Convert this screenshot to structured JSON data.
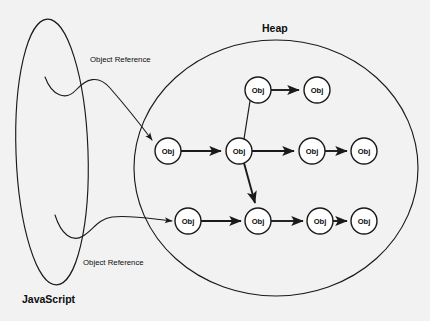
{
  "diagram": {
    "title_visible": false,
    "background_color": "#f2f2f2",
    "line_color": "#1a1a1a",
    "node_fill": "#ffffff",
    "regions": [
      {
        "id": "javascript",
        "label": "JavaScript",
        "shape": "ellipse",
        "label_x": 22,
        "label_y": 303,
        "cx": 52,
        "cy": 152,
        "rx": 36,
        "ry": 133,
        "rotation": -2
      },
      {
        "id": "heap",
        "label": "Heap",
        "shape": "ellipse",
        "label_x": 262,
        "label_y": 32,
        "cx": 276,
        "cy": 168,
        "rx": 142,
        "ry": 128,
        "rotation": 0
      }
    ],
    "reference_labels": [
      {
        "id": "ref-top",
        "text": "Object Reference",
        "x": 90,
        "y": 62
      },
      {
        "id": "ref-bottom",
        "text": "Object Reference",
        "x": 83,
        "y": 265
      }
    ],
    "node_label": "Obj",
    "node_radius": 13,
    "nodes": [
      {
        "id": "t1",
        "label": "Obj",
        "x": 258,
        "y": 90,
        "row": "top"
      },
      {
        "id": "t2",
        "label": "Obj",
        "x": 317,
        "y": 90,
        "row": "top"
      },
      {
        "id": "m1",
        "label": "Obj",
        "x": 168,
        "y": 151,
        "row": "middle"
      },
      {
        "id": "m2",
        "label": "Obj",
        "x": 239,
        "y": 151,
        "row": "middle"
      },
      {
        "id": "m3",
        "label": "Obj",
        "x": 312,
        "y": 151,
        "row": "middle"
      },
      {
        "id": "m4",
        "label": "Obj",
        "x": 364,
        "y": 151,
        "row": "middle"
      },
      {
        "id": "b1",
        "label": "Obj",
        "x": 188,
        "y": 221,
        "row": "bottom"
      },
      {
        "id": "b2",
        "label": "Obj",
        "x": 258,
        "y": 221,
        "row": "bottom"
      },
      {
        "id": "b3",
        "label": "Obj",
        "x": 320,
        "y": 221,
        "row": "bottom"
      },
      {
        "id": "b4",
        "label": "Obj",
        "x": 364,
        "y": 221,
        "row": "bottom"
      }
    ],
    "edges": [
      {
        "id": "e-t1-t2",
        "from": "t1",
        "to": "t2",
        "kind": "arrow"
      },
      {
        "id": "e-m1-m2",
        "from": "m1",
        "to": "m2",
        "kind": "arrow"
      },
      {
        "id": "e-m2-m3",
        "from": "m2",
        "to": "m3",
        "kind": "arrow"
      },
      {
        "id": "e-m3-m4",
        "from": "m3",
        "to": "m4",
        "kind": "arrow"
      },
      {
        "id": "e-b1-b2",
        "from": "b1",
        "to": "b2",
        "kind": "arrow"
      },
      {
        "id": "e-b2-b3",
        "from": "b2",
        "to": "b3",
        "kind": "arrow"
      },
      {
        "id": "e-b3-b4",
        "from": "b3",
        "to": "b4",
        "kind": "arrow"
      },
      {
        "id": "e-t1-m2",
        "from": "t1",
        "to": "m2",
        "kind": "plain"
      },
      {
        "id": "e-m2-b2",
        "from": "m2",
        "to": "b2",
        "kind": "arrow-diagonal"
      }
    ],
    "references": [
      {
        "id": "ref-curve-top",
        "from_region": "javascript",
        "to_node": "m1",
        "kind": "curved-arrow"
      },
      {
        "id": "ref-curve-bottom",
        "from_region": "javascript",
        "to_node": "b1",
        "kind": "curved-arrow"
      }
    ]
  }
}
